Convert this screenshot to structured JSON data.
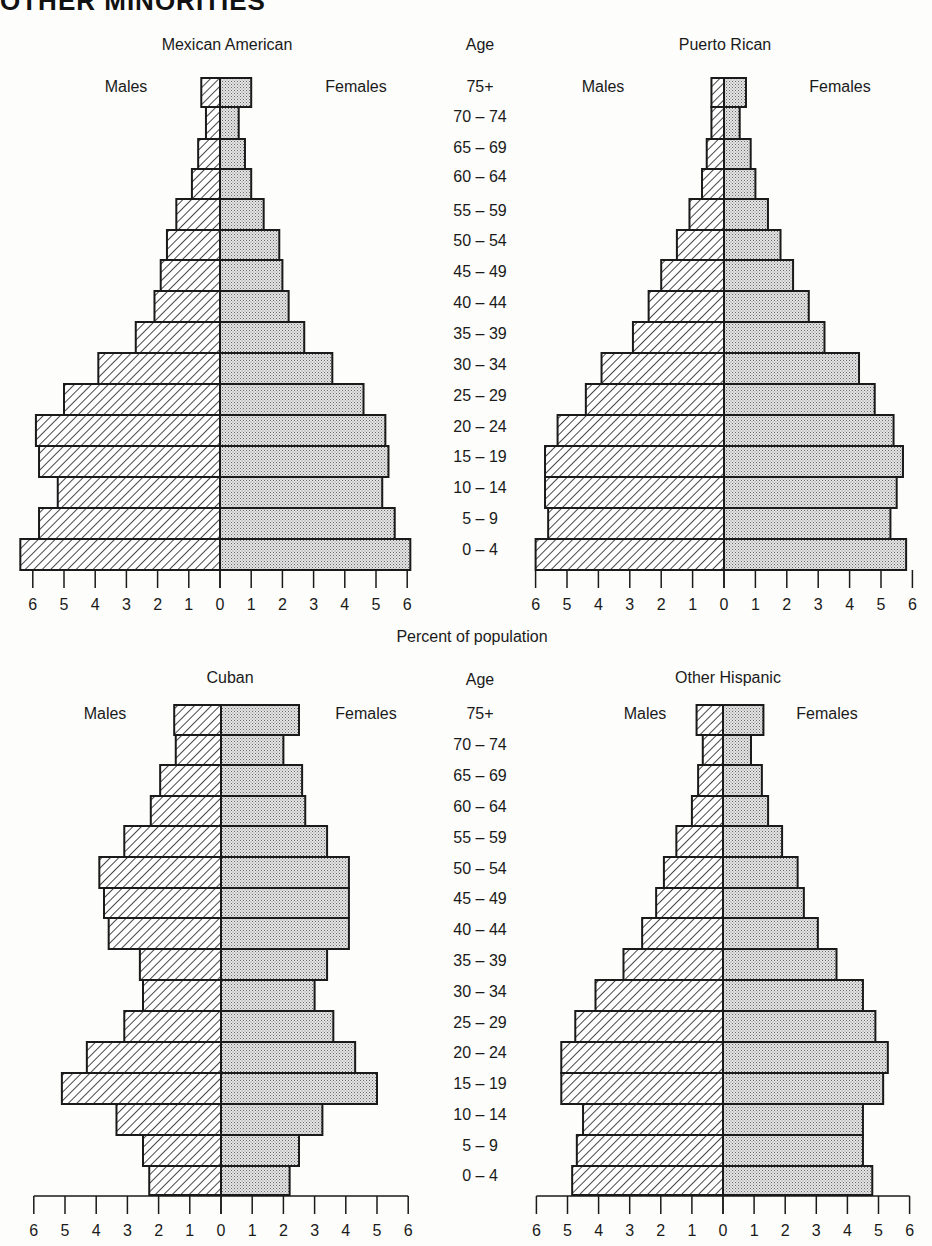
{
  "header": {
    "text": "OTHER MINORITIES"
  },
  "shared": {
    "age_label": "Age",
    "males_label": "Males",
    "females_label": "Females",
    "xlabel": "Percent of population",
    "age_groups": [
      "75+",
      "70 – 74",
      "65 – 69",
      "60 – 64",
      "55 – 59",
      "50 – 54",
      "45 – 49",
      "40 – 44",
      "35 – 39",
      "30 – 34",
      "25 – 29",
      "20 – 24",
      "15 – 19",
      "10 – 14",
      "5 – 9",
      "0 – 4"
    ],
    "ticks": [
      6,
      5,
      4,
      3,
      2,
      1,
      0,
      1,
      2,
      3,
      4,
      5,
      6
    ],
    "colors": {
      "outline": "#1a1a1a",
      "male_hatch": "#1a1a1a",
      "female_stipple": "#9a9a9a",
      "background": "#fdfdfb"
    }
  },
  "chart_data": [
    {
      "type": "bar",
      "subtype": "population_pyramid",
      "title": "Mexican American",
      "xlabel": "Percent of population",
      "ylabel": "Age",
      "xlim": [
        -6,
        6
      ],
      "grid": false,
      "legend": {
        "left": "Males",
        "right": "Females",
        "position": "top"
      },
      "categories": [
        "75+",
        "70-74",
        "65-69",
        "60-64",
        "55-59",
        "50-54",
        "45-49",
        "40-44",
        "35-39",
        "30-34",
        "25-29",
        "20-24",
        "15-19",
        "10-14",
        "5-9",
        "0-4"
      ],
      "series": [
        {
          "name": "Males",
          "values": [
            0.6,
            0.45,
            0.7,
            0.9,
            1.4,
            1.7,
            1.9,
            2.1,
            2.7,
            3.9,
            5.0,
            5.9,
            5.8,
            5.2,
            5.8,
            6.4
          ]
        },
        {
          "name": "Females",
          "values": [
            1.0,
            0.6,
            0.8,
            1.0,
            1.4,
            1.9,
            2.0,
            2.2,
            2.7,
            3.6,
            4.6,
            5.3,
            5.4,
            5.2,
            5.6,
            6.1
          ]
        }
      ]
    },
    {
      "type": "bar",
      "subtype": "population_pyramid",
      "title": "Puerto Rican",
      "xlabel": "Percent of population",
      "ylabel": "Age",
      "xlim": [
        -6,
        6
      ],
      "grid": false,
      "legend": {
        "left": "Males",
        "right": "Females",
        "position": "top"
      },
      "categories": [
        "75+",
        "70-74",
        "65-69",
        "60-64",
        "55-59",
        "50-54",
        "45-49",
        "40-44",
        "35-39",
        "30-34",
        "25-29",
        "20-24",
        "15-19",
        "10-14",
        "5-9",
        "0-4"
      ],
      "series": [
        {
          "name": "Males",
          "values": [
            0.4,
            0.4,
            0.55,
            0.7,
            1.1,
            1.5,
            2.0,
            2.4,
            2.9,
            3.9,
            4.4,
            5.3,
            5.7,
            5.7,
            5.6,
            6.0
          ]
        },
        {
          "name": "Females",
          "values": [
            0.7,
            0.5,
            0.85,
            1.0,
            1.4,
            1.8,
            2.2,
            2.7,
            3.2,
            4.3,
            4.8,
            5.4,
            5.7,
            5.5,
            5.3,
            5.8
          ]
        }
      ]
    },
    {
      "type": "bar",
      "subtype": "population_pyramid",
      "title": "Cuban",
      "xlabel": "Percent of population",
      "ylabel": "Age",
      "xlim": [
        -6,
        6
      ],
      "grid": false,
      "legend": {
        "left": "Males",
        "right": "Females",
        "position": "top"
      },
      "categories": [
        "75+",
        "70-74",
        "65-69",
        "60-64",
        "55-59",
        "50-54",
        "45-49",
        "40-44",
        "35-39",
        "30-34",
        "25-29",
        "20-24",
        "15-19",
        "10-14",
        "5-9",
        "0-4"
      ],
      "series": [
        {
          "name": "Males",
          "values": [
            1.5,
            1.45,
            1.95,
            2.25,
            3.1,
            3.9,
            3.75,
            3.6,
            2.6,
            2.5,
            3.1,
            4.3,
            5.1,
            3.35,
            2.5,
            2.3
          ]
        },
        {
          "name": "Females",
          "values": [
            2.5,
            2.0,
            2.6,
            2.7,
            3.4,
            4.1,
            4.1,
            4.1,
            3.4,
            3.0,
            3.6,
            4.3,
            5.0,
            3.25,
            2.5,
            2.2
          ]
        }
      ]
    },
    {
      "type": "bar",
      "subtype": "population_pyramid",
      "title": "Other Hispanic",
      "xlabel": "Percent of population",
      "ylabel": "Age",
      "xlim": [
        -6,
        6
      ],
      "grid": false,
      "legend": {
        "left": "Males",
        "right": "Females",
        "position": "top"
      },
      "categories": [
        "75+",
        "70-74",
        "65-69",
        "60-64",
        "55-59",
        "50-54",
        "45-49",
        "40-44",
        "35-39",
        "30-34",
        "25-29",
        "20-24",
        "15-19",
        "10-14",
        "5-9",
        "0-4"
      ],
      "series": [
        {
          "name": "Males",
          "values": [
            0.85,
            0.65,
            0.8,
            1.0,
            1.5,
            1.9,
            2.15,
            2.6,
            3.2,
            4.1,
            4.75,
            5.2,
            5.2,
            4.5,
            4.7,
            4.85
          ]
        },
        {
          "name": "Females",
          "values": [
            1.3,
            0.9,
            1.25,
            1.45,
            1.9,
            2.4,
            2.6,
            3.05,
            3.65,
            4.5,
            4.9,
            5.3,
            5.15,
            4.5,
            4.5,
            4.8
          ]
        }
      ]
    }
  ],
  "layout": {
    "panels": [
      {
        "zero_x": 220,
        "scale": 31.2,
        "title_x": 227,
        "title_y": 50,
        "legend_y": 92,
        "males_x": 126,
        "females_x": 356,
        "rows_top": [
          78,
          107,
          139,
          169,
          199,
          230,
          260,
          291,
          322,
          353,
          384,
          415,
          446,
          477,
          508,
          539
        ],
        "rows_bottom": 570,
        "axis_baseline": false,
        "tick_top": 570,
        "tick_bottom": 588,
        "tick_label_y": 610
      },
      {
        "zero_x": 724,
        "scale": 31.4,
        "title_x": 725,
        "title_y": 50,
        "legend_y": 92,
        "males_x": 603,
        "females_x": 840,
        "rows_top": [
          78,
          107,
          139,
          169,
          199,
          230,
          260,
          291,
          322,
          353,
          384,
          415,
          446,
          477,
          508,
          539
        ],
        "rows_bottom": 570,
        "axis_baseline": false,
        "tick_top": 570,
        "tick_bottom": 588,
        "tick_label_y": 610
      },
      {
        "zero_x": 221,
        "scale": 31.2,
        "title_x": 230,
        "title_y": 683,
        "legend_y": 719,
        "males_x": 105,
        "females_x": 366,
        "rows_top": [
          705,
          735,
          765,
          796,
          826,
          857,
          888,
          918,
          949,
          980,
          1011,
          1042,
          1073,
          1104,
          1135,
          1166
        ],
        "rows_bottom": 1195,
        "axis_baseline": true,
        "tick_top": 1196,
        "tick_bottom": 1214,
        "tick_label_y": 1236
      },
      {
        "zero_x": 723,
        "scale": 31.1,
        "title_x": 728,
        "title_y": 683,
        "legend_y": 719,
        "males_x": 645,
        "females_x": 827,
        "rows_top": [
          705,
          735,
          765,
          796,
          826,
          857,
          888,
          918,
          949,
          980,
          1011,
          1042,
          1073,
          1104,
          1135,
          1166
        ],
        "rows_bottom": 1195,
        "axis_baseline": true,
        "tick_top": 1196,
        "tick_bottom": 1214,
        "tick_label_y": 1236
      }
    ],
    "age_columns": [
      {
        "x": 480,
        "age_y": 50,
        "rows_y": [
          92,
          122,
          153,
          182,
          216,
          246,
          277,
          308,
          339,
          370,
          401,
          432,
          462,
          493,
          524,
          555
        ]
      },
      {
        "x": 480,
        "age_y": 685,
        "rows_y": [
          719,
          750,
          781,
          812,
          843,
          874,
          904,
          935,
          966,
          997,
          1028,
          1058,
          1089,
          1120,
          1151,
          1181
        ]
      }
    ],
    "xlabel_x": 472,
    "xlabel_y": 642
  }
}
